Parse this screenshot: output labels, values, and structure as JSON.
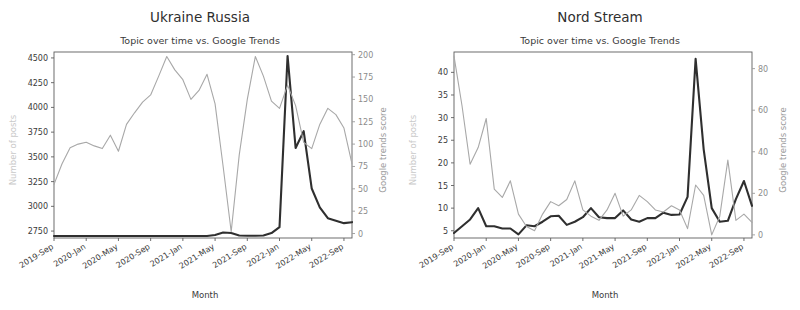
{
  "figure": {
    "width": 800,
    "height": 310,
    "background": "#ffffff",
    "panel_count": 2
  },
  "colors": {
    "posts_line": "#2f2f2f",
    "trends_line": "#a8a8a8",
    "spine": "#5e5e5e",
    "text": "#3a3a3a",
    "muted_text": "#9a9a9a",
    "faint_label": "#c9c9c9"
  },
  "common": {
    "subtitle": "Topic over time vs. Google Trends",
    "xlabel": "Month",
    "ylabel_left": "Number of posts",
    "ylabel_right": "Google trends score",
    "xticklabels": [
      "2019-Sep",
      "2020-Jan",
      "2020-May",
      "2020-Sep",
      "2021-Jan",
      "2021-May",
      "2021-Sep",
      "2022-Jan",
      "2022-May",
      "2022-Sep"
    ],
    "x_months": [
      "2019-Sep",
      "2019-Oct",
      "2019-Nov",
      "2019-Dec",
      "2020-Jan",
      "2020-Feb",
      "2020-Mar",
      "2020-Apr",
      "2020-May",
      "2020-Jun",
      "2020-Jul",
      "2020-Aug",
      "2020-Sep",
      "2020-Oct",
      "2020-Nov",
      "2020-Dec",
      "2021-Jan",
      "2021-Feb",
      "2021-Mar",
      "2021-Apr",
      "2021-May",
      "2021-Jun",
      "2021-Jul",
      "2021-Aug",
      "2021-Sep",
      "2021-Oct",
      "2021-Nov",
      "2021-Dec",
      "2022-Jan",
      "2022-Feb",
      "2022-Mar",
      "2022-Apr",
      "2022-May",
      "2022-Jun",
      "2022-Jul",
      "2022-Aug",
      "2022-Sep",
      "2022-Oct"
    ]
  },
  "chart_data": [
    {
      "id": "ukraine-russia",
      "type": "line",
      "title": "Ukraine Russia",
      "subtitle": "Topic over time vs. Google Trends",
      "xlabel": "Month",
      "ylabel": "Number of posts",
      "ylabel_secondary": "Google trends score",
      "grid": false,
      "legend": "none",
      "x": [
        "2019-Sep",
        "2019-Oct",
        "2019-Nov",
        "2019-Dec",
        "2020-Jan",
        "2020-Feb",
        "2020-Mar",
        "2020-Apr",
        "2020-May",
        "2020-Jun",
        "2020-Jul",
        "2020-Aug",
        "2020-Sep",
        "2020-Oct",
        "2020-Nov",
        "2020-Dec",
        "2021-Jan",
        "2021-Feb",
        "2021-Mar",
        "2021-Apr",
        "2021-May",
        "2021-Jun",
        "2021-Jul",
        "2021-Aug",
        "2021-Sep",
        "2021-Oct",
        "2021-Nov",
        "2021-Dec",
        "2022-Jan",
        "2022-Feb",
        "2022-Mar",
        "2022-Apr",
        "2022-May",
        "2022-Jun",
        "2022-Jul",
        "2022-Aug",
        "2022-Sep",
        "2022-Oct"
      ],
      "yticks_left": [
        2750,
        3000,
        3250,
        3500,
        3750,
        4000,
        4250,
        4500
      ],
      "ylim_left": [
        2680,
        4560
      ],
      "yticks_right": [
        0,
        25,
        50,
        75,
        100,
        125,
        150,
        175,
        200
      ],
      "ylim_right": [
        -5,
        203
      ],
      "xticklabels": [
        "2019-Sep",
        "2020-Jan",
        "2020-May",
        "2020-Sep",
        "2021-Jan",
        "2021-May",
        "2021-Sep",
        "2022-Jan",
        "2022-May",
        "2022-Sep"
      ],
      "xtick_indices": [
        0,
        4,
        8,
        12,
        16,
        20,
        24,
        28,
        32,
        36
      ],
      "series": [
        {
          "name": "Number of posts",
          "axis": "left",
          "color": "#2f2f2f",
          "linewidth": 2.1,
          "values": [
            2700,
            2700,
            2700,
            2700,
            2700,
            2700,
            2700,
            2700,
            2700,
            2700,
            2700,
            2700,
            2700,
            2700,
            2700,
            2700,
            2700,
            2700,
            2700,
            2700,
            2710,
            2735,
            2730,
            2705,
            2702,
            2702,
            2705,
            2730,
            2790,
            4520,
            3590,
            3760,
            3180,
            2990,
            2880,
            2855,
            2830,
            2840
          ]
        },
        {
          "name": "Google trends score",
          "axis": "right",
          "color": "#a8a8a8",
          "linewidth": 1.1,
          "values": [
            55,
            78,
            96,
            100,
            102,
            98,
            95,
            110,
            92,
            122,
            135,
            147,
            155,
            176,
            198,
            183,
            172,
            150,
            160,
            178,
            145,
            75,
            2,
            88,
            150,
            198,
            176,
            148,
            140,
            166,
            143,
            102,
            95,
            122,
            140,
            133,
            118,
            78
          ]
        }
      ]
    },
    {
      "id": "nord-stream",
      "type": "line",
      "title": "Nord Stream",
      "subtitle": "Topic over time vs. Google Trends",
      "xlabel": "Month",
      "ylabel": "Number of posts",
      "ylabel_secondary": "Google trends score",
      "grid": false,
      "legend": "none",
      "x": [
        "2019-Sep",
        "2019-Oct",
        "2019-Nov",
        "2019-Dec",
        "2020-Jan",
        "2020-Feb",
        "2020-Mar",
        "2020-Apr",
        "2020-May",
        "2020-Jun",
        "2020-Jul",
        "2020-Aug",
        "2020-Sep",
        "2020-Oct",
        "2020-Nov",
        "2020-Dec",
        "2021-Jan",
        "2021-Feb",
        "2021-Mar",
        "2021-Apr",
        "2021-May",
        "2021-Jun",
        "2021-Jul",
        "2021-Aug",
        "2021-Sep",
        "2021-Oct",
        "2021-Nov",
        "2021-Dec",
        "2022-Jan",
        "2022-Feb",
        "2022-Mar",
        "2022-Apr",
        "2022-May",
        "2022-Jun",
        "2022-Jul",
        "2022-Aug",
        "2022-Sep",
        "2022-Oct"
      ],
      "yticks_left": [
        5,
        10,
        15,
        20,
        25,
        30,
        35,
        40
      ],
      "ylim_left": [
        3.4,
        44.5
      ],
      "yticks_right": [
        0,
        20,
        40,
        60,
        80
      ],
      "ylim_right": [
        -1.5,
        88
      ],
      "xticklabels": [
        "2019-Sep",
        "2020-Jan",
        "2020-May",
        "2020-Sep",
        "2021-Jan",
        "2021-May",
        "2021-Sep",
        "2022-Jan",
        "2022-May",
        "2022-Sep"
      ],
      "xtick_indices": [
        0,
        4,
        8,
        12,
        16,
        20,
        24,
        28,
        32,
        36
      ],
      "series": [
        {
          "name": "Number of posts",
          "axis": "left",
          "color": "#2f2f2f",
          "linewidth": 2.1,
          "values": [
            4.5,
            6.0,
            7.5,
            10.0,
            6.0,
            6.0,
            5.5,
            5.5,
            4.2,
            6.2,
            6.0,
            7.0,
            8.2,
            8.3,
            6.3,
            7.0,
            8.0,
            10.0,
            8.0,
            7.8,
            7.8,
            9.5,
            7.5,
            7.0,
            7.8,
            7.8,
            9.0,
            8.5,
            8.6,
            12.5,
            43.0,
            23.0,
            10.0,
            7.0,
            7.2,
            12.0,
            16.0,
            10.5
          ]
        },
        {
          "name": "Google trends score",
          "axis": "right",
          "color": "#a8a8a8",
          "linewidth": 1.1,
          "values": [
            86,
            62,
            34,
            42,
            56,
            22,
            18,
            26,
            10,
            4,
            2,
            10,
            16,
            14,
            17,
            26,
            12,
            9,
            7,
            12,
            20,
            9,
            12,
            19,
            16,
            12,
            11,
            14,
            12,
            3,
            24,
            19,
            0,
            9,
            36,
            7,
            10,
            6
          ]
        }
      ]
    }
  ]
}
